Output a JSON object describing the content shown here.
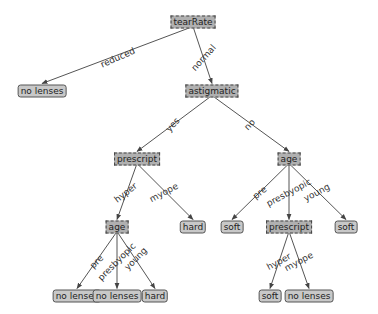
{
  "diagram": {
    "type": "decision-tree",
    "colors": {
      "decision_fill": "#b0b0b0",
      "leaf_fill": "#c8c8c8",
      "edge": "#555555",
      "text": "#222222",
      "background": "#ffffff"
    },
    "nodes": [
      {
        "id": "n0",
        "label": "tearRate",
        "kind": "decision",
        "x": 193,
        "y": 22
      },
      {
        "id": "n1",
        "label": "no lenses",
        "kind": "leaf",
        "x": 42,
        "y": 91
      },
      {
        "id": "n2",
        "label": "astigmatic",
        "kind": "decision",
        "x": 212,
        "y": 91
      },
      {
        "id": "n3",
        "label": "prescript",
        "kind": "decision",
        "x": 137,
        "y": 159
      },
      {
        "id": "n4",
        "label": "age",
        "kind": "decision",
        "x": 289,
        "y": 159
      },
      {
        "id": "n5",
        "label": "age",
        "kind": "decision",
        "x": 117,
        "y": 227
      },
      {
        "id": "n6",
        "label": "hard",
        "kind": "leaf",
        "x": 193,
        "y": 227
      },
      {
        "id": "n7",
        "label": "soft",
        "kind": "leaf",
        "x": 232,
        "y": 227
      },
      {
        "id": "n8",
        "label": "prescript",
        "kind": "decision",
        "x": 289,
        "y": 227
      },
      {
        "id": "n9",
        "label": "soft",
        "kind": "leaf",
        "x": 346,
        "y": 227
      },
      {
        "id": "n10",
        "label": "no lenses",
        "kind": "leaf",
        "x": 77,
        "y": 296
      },
      {
        "id": "n11",
        "label": "no lenses",
        "kind": "leaf",
        "x": 117,
        "y": 296
      },
      {
        "id": "n12",
        "label": "hard",
        "kind": "leaf",
        "x": 155,
        "y": 296
      },
      {
        "id": "n13",
        "label": "soft",
        "kind": "leaf",
        "x": 270,
        "y": 296
      },
      {
        "id": "n14",
        "label": "no lenses",
        "kind": "leaf",
        "x": 309,
        "y": 296
      }
    ],
    "edges": [
      {
        "from": "n0",
        "to": "n1",
        "label": "reduced",
        "lx": 118,
        "ly": 58,
        "angle": -24
      },
      {
        "from": "n0",
        "to": "n2",
        "label": "normal",
        "lx": 204,
        "ly": 58,
        "angle": -48
      },
      {
        "from": "n2",
        "to": "n3",
        "label": "yes",
        "lx": 173,
        "ly": 125,
        "angle": -48
      },
      {
        "from": "n2",
        "to": "n4",
        "label": "no",
        "lx": 250,
        "ly": 125,
        "angle": -48
      },
      {
        "from": "n3",
        "to": "n5",
        "label": "hyper",
        "lx": 126,
        "ly": 193,
        "angle": -38
      },
      {
        "from": "n3",
        "to": "n6",
        "label": "myope",
        "lx": 164,
        "ly": 193,
        "angle": -28
      },
      {
        "from": "n4",
        "to": "n7",
        "label": "pre",
        "lx": 260,
        "ly": 193,
        "angle": -38
      },
      {
        "from": "n4",
        "to": "n8",
        "label": "presbyopic",
        "lx": 289,
        "ly": 193,
        "angle": -28
      },
      {
        "from": "n4",
        "to": "n9",
        "label": "young",
        "lx": 317,
        "ly": 193,
        "angle": -28
      },
      {
        "from": "n5",
        "to": "n10",
        "label": "pre",
        "lx": 97,
        "ly": 262,
        "angle": -45
      },
      {
        "from": "n5",
        "to": "n11",
        "label": "presbyopic",
        "lx": 117,
        "ly": 262,
        "angle": -45
      },
      {
        "from": "n5",
        "to": "n12",
        "label": "young",
        "lx": 136,
        "ly": 259,
        "angle": -45
      },
      {
        "from": "n8",
        "to": "n13",
        "label": "hyper",
        "lx": 279,
        "ly": 262,
        "angle": -28
      },
      {
        "from": "n8",
        "to": "n14",
        "label": "myope",
        "lx": 299,
        "ly": 262,
        "angle": -28
      }
    ]
  }
}
